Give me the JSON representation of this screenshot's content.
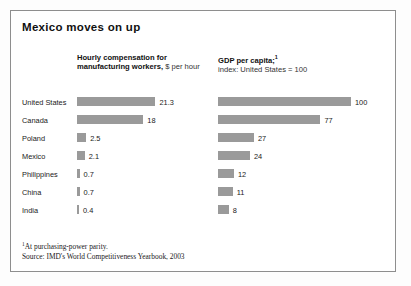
{
  "title": "Mexico moves on up",
  "columns": {
    "left": {
      "heading_line1": "Hourly compensation for",
      "heading_line2_bold": "manufacturing workers,",
      "heading_line2_light": " $ per hour"
    },
    "right": {
      "heading_line1": "GDP per capita;",
      "heading_footnote_marker": "1",
      "heading_line2": "index: United States = 100"
    }
  },
  "footnotes": {
    "marker": "1",
    "note": "At purchasing-power parity.",
    "source": "Source: IMD's World Competitiveness Yearbook, 2003"
  },
  "colors": {
    "bar": "#9a9a9a",
    "frame": "#8e8e8e",
    "text": "#1a1a1a"
  },
  "chart_data": {
    "type": "bar",
    "title": "Mexico moves on up",
    "orientation": "horizontal",
    "grid": false,
    "legend": "none",
    "categories": [
      "United States",
      "Canada",
      "Poland",
      "Mexico",
      "Philippines",
      "China",
      "India"
    ],
    "series": [
      {
        "name": "Hourly compensation for manufacturing workers, $ per hour",
        "unit": "$ per hour",
        "values": [
          21.3,
          18,
          2.5,
          2.1,
          0.7,
          0.7,
          0.4
        ],
        "labels": [
          "21.3",
          "18",
          "2.5",
          "2.1",
          "0.7",
          "0.7",
          "0.4"
        ],
        "xlim": [
          0,
          22
        ]
      },
      {
        "name": "GDP per capita; index: United States = 100",
        "unit": "index (United States = 100)",
        "values": [
          100,
          77,
          27,
          24,
          12,
          11,
          8
        ],
        "labels": [
          "100",
          "77",
          "27",
          "24",
          "12",
          "11",
          "8"
        ],
        "xlim": [
          0,
          100
        ]
      }
    ],
    "xlabel": "",
    "ylabel": "",
    "source": "Source: IMD's World Competitiveness Yearbook, 2003",
    "footnote": "1 At purchasing-power parity."
  }
}
